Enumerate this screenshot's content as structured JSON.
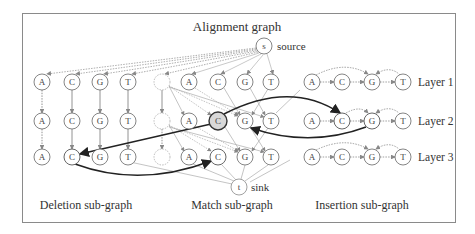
{
  "title": "Alignment graph",
  "source": {
    "glyph": "s",
    "label": "source"
  },
  "sink": {
    "glyph": "t",
    "label": "sink"
  },
  "layers": [
    "Layer 1",
    "Layer 2",
    "Layer 3"
  ],
  "subgraphs": {
    "deletion": {
      "label": "Deletion sub-graph",
      "nodes": [
        "A",
        "C",
        "G",
        "T"
      ]
    },
    "match": {
      "label": "Match sub-graph",
      "nodes": [
        "A",
        "C",
        "G",
        "T"
      ],
      "has_dashed_placeholder": true
    },
    "insertion": {
      "label": "Insertion sub-graph",
      "nodes": [
        "A",
        "C",
        "G",
        "T"
      ]
    }
  },
  "highlighted_path": [
    {
      "from": "deletion.layer3.C",
      "to": "match.layer3.C"
    },
    {
      "from": "match.layer2.C",
      "to": "deletion.layer3.C"
    },
    {
      "from": "match.layer2.C",
      "to": "insertion.layer2.C"
    },
    {
      "from": "insertion.layer2.G",
      "to": "match.layer2.G"
    }
  ],
  "highlighted_node": "match.layer2.C",
  "colors": {
    "frame": "#8a8a8a",
    "node_stroke": "#666666",
    "edge": "#888888",
    "path": "#333333",
    "highlight_fill": "#d8d8d8"
  }
}
